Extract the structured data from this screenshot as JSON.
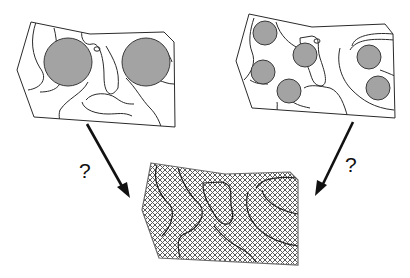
{
  "diagram": {
    "title": "",
    "left_map": {
      "label": "",
      "description": "map with two large circular sampling areas",
      "circles": [
        {
          "cx": 68,
          "cy": 62,
          "r": 24
        },
        {
          "cx": 146,
          "cy": 61,
          "r": 24
        }
      ]
    },
    "right_map": {
      "label": "",
      "description": "map with seven small circular sampling areas",
      "circles": [
        {
          "cx": 265,
          "cy": 33,
          "r": 12
        },
        {
          "cx": 305,
          "cy": 55,
          "r": 12
        },
        {
          "cx": 263,
          "cy": 72,
          "r": 12
        },
        {
          "cx": 289,
          "cy": 91,
          "r": 12
        },
        {
          "cx": 368,
          "cy": 56,
          "r": 12
        },
        {
          "cx": 377,
          "cy": 87,
          "r": 12
        }
      ]
    },
    "target_map": {
      "label": "",
      "description": "cross-hatched full-coverage map"
    },
    "arrows": [
      {
        "from": "left_map",
        "to": "target_map",
        "label": "?"
      },
      {
        "from": "right_map",
        "to": "target_map",
        "label": "?"
      }
    ],
    "colors": {
      "circle_fill": "#a3a3a3",
      "line": "#2a2a2a",
      "hatch": "#555555",
      "background": "#ffffff"
    }
  }
}
